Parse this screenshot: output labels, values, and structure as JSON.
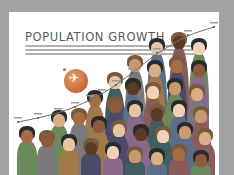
{
  "chart_data": {
    "type": "line",
    "title": "POPULATION GROWTH",
    "subtitle_lines": 3,
    "xlabel": "",
    "ylabel": "",
    "points": [
      {
        "x": 18,
        "y": 122,
        "label": ""
      },
      {
        "x": 38,
        "y": 118,
        "label": ""
      },
      {
        "x": 58,
        "y": 113,
        "label": ""
      },
      {
        "x": 75,
        "y": 107,
        "label": ""
      },
      {
        "x": 90,
        "y": 100,
        "label": ""
      },
      {
        "x": 102,
        "y": 94,
        "label": ""
      },
      {
        "x": 116,
        "y": 85,
        "label": ""
      },
      {
        "x": 132,
        "y": 73,
        "label": ""
      },
      {
        "x": 157,
        "y": 53,
        "label": ""
      },
      {
        "x": 188,
        "y": 35,
        "label": ""
      },
      {
        "x": 214,
        "y": 27,
        "label": ""
      }
    ],
    "note": "Curve point positions are pixel estimates; point labels are illegible at this resolution and left blank."
  },
  "infographic": {
    "title": "POPULATION GROWTH",
    "globe_icon": "globe-with-plane-icon",
    "colors": {
      "background": "#a3a3a3",
      "card": "#ffffff",
      "title": "#5a5a5a",
      "globe": "#d07a48",
      "curve": "#6f6f6f"
    }
  }
}
